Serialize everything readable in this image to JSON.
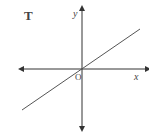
{
  "figure": {
    "label": "T",
    "x_axis_label": "x",
    "y_axis_label": "y",
    "origin_label": "O",
    "line": {
      "description": "straight line through the origin with positive slope"
    },
    "colors": {
      "axis": "#333333",
      "line": "#555555",
      "text": "#333333"
    }
  }
}
